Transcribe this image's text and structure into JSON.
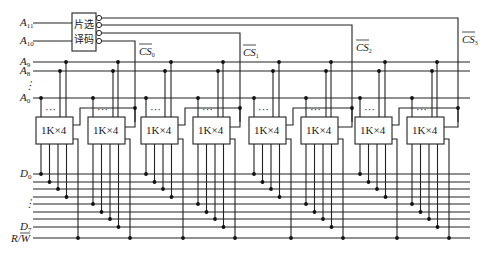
{
  "diagram": {
    "title": "",
    "decoder": {
      "label_line1": "片选",
      "label_line2": "译码"
    },
    "inputs": {
      "a11": "A",
      "a11_sub": "11",
      "a10": "A",
      "a10_sub": "10"
    },
    "address_lines": [
      {
        "name": "A",
        "sub": "9"
      },
      {
        "name": "A",
        "sub": "8"
      },
      {
        "name": "⋮",
        "sub": ""
      },
      {
        "name": "A",
        "sub": "0"
      }
    ],
    "chip_selects": [
      {
        "name": "CS",
        "sub": "0"
      },
      {
        "name": "CS",
        "sub": "1"
      },
      {
        "name": "CS",
        "sub": "2"
      },
      {
        "name": "CS",
        "sub": "3"
      }
    ],
    "chips": [
      {
        "label": "1K×4",
        "dots": "···"
      },
      {
        "label": "1K×4",
        "dots": "···"
      },
      {
        "label": "1K×4",
        "dots": "···"
      },
      {
        "label": "1K×4",
        "dots": "···"
      },
      {
        "label": "1K×4",
        "dots": "···"
      },
      {
        "label": "1K×4",
        "dots": "···"
      },
      {
        "label": "1K×4",
        "dots": "···"
      },
      {
        "label": "1K×4",
        "dots": "···"
      }
    ],
    "data_lines": {
      "d0": "D",
      "d0_sub": "0",
      "ellipsis": "⋮",
      "d7": "D",
      "d7_sub": "7",
      "rw": "R/W"
    },
    "colors": {
      "line": "#222222",
      "background": "#ffffff"
    }
  }
}
